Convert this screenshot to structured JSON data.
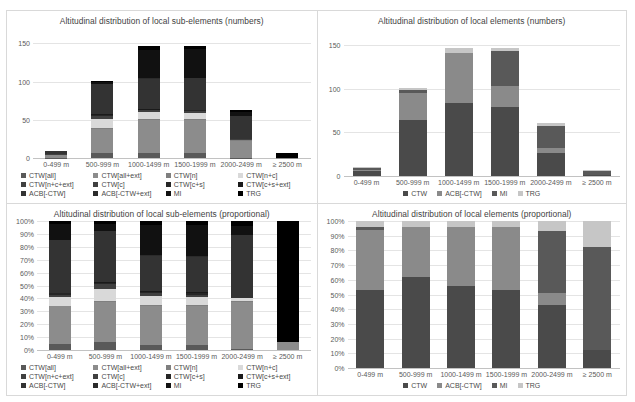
{
  "figure": {
    "background": "#ffffff",
    "panel_border": "#d9d9d9"
  },
  "series_colors": {
    "CTW[all]": "#595959",
    "CTW[all+ext]": "#8c8c8c",
    "CTW[n]": "#7f7f7f",
    "CTW[n+c]": "#d9d9d9",
    "CTW[n+c+ext]": "#404040",
    "CTW[c]": "#404040",
    "CTW[c+s]": "#262626",
    "CTW[c+s+ext]": "#1a1a1a",
    "ACB[-CTW]": "#333333",
    "ACB[-CTW+ext]": "#2b2b2b",
    "MI": "#111111",
    "TRG": "#000000",
    "CTW": "#4a4a4a",
    "ACB[-CTW]_elem": "#8a8a8a",
    "MI_elem": "#595959",
    "TRG_elem": "#c6c6c6"
  },
  "categories": [
    "0-499 m",
    "500-999 m",
    "1000-1499 m",
    "1500-1999 m",
    "2000-2499 m",
    "≥ 2500 m"
  ],
  "panels": {
    "top_left": {
      "name": "sub-elements-numbers",
      "chart_data": {
        "type": "bar",
        "stacked": true,
        "title": "Altitudinal distribution of local sub-elements (numbers)",
        "xlabel": "",
        "ylabel": "",
        "ylim": [
          0,
          170
        ],
        "yticks": [
          0,
          50,
          100,
          150
        ],
        "ytick_labels": [
          "0",
          "50",
          "100",
          "150"
        ],
        "grid": true,
        "legend_position": "bottom",
        "categories": [
          "0-499 m",
          "500-999 m",
          "1000-1499 m",
          "1500-1999 m",
          "2000-2499 m",
          "≥ 2500 m"
        ],
        "series": [
          {
            "name": "CTW[all]",
            "color": "#595959",
            "values": [
              2,
              8,
              7,
              7,
              1,
              0
            ]
          },
          {
            "name": "CTW[all+ext]",
            "color": "#8c8c8c",
            "values": [
              12,
              42,
              47,
              47,
              36,
              2
            ]
          },
          {
            "name": "CTW[n]",
            "color": "#7f7f7f",
            "values": [
              0,
              1,
              1,
              1,
              1,
              0
            ]
          },
          {
            "name": "CTW[n+c]",
            "color": "#d9d9d9",
            "values": [
              4,
              16,
              10,
              9,
              2,
              0
            ]
          },
          {
            "name": "CTW[n+c+ext]",
            "color": "#404040",
            "values": [
              1,
              1,
              1,
              1,
              1,
              0
            ]
          },
          {
            "name": "CTW[c]",
            "color": "#404040",
            "values": [
              1,
              4,
              1,
              1,
              0,
              0
            ]
          },
          {
            "name": "CTW[c+s]",
            "color": "#262626",
            "values": [
              1,
              1,
              1,
              1,
              0,
              0
            ]
          },
          {
            "name": "CTW[c+s+ext]",
            "color": "#1a1a1a",
            "values": [
              0,
              1,
              1,
              1,
              0,
              0
            ]
          },
          {
            "name": "ACB[-CTW]",
            "color": "#333333",
            "values": [
              17,
              51,
              42,
              44,
              50,
              0
            ]
          },
          {
            "name": "ACB[-CTW+ext]",
            "color": "#2b2b2b",
            "values": [
              0,
              0,
              1,
              1,
              0,
              0
            ]
          },
          {
            "name": "MI",
            "color": "#111111",
            "values": [
              2,
              4,
              40,
              40,
              8,
              0
            ]
          },
          {
            "name": "TRG",
            "color": "#000000",
            "values": [
              1,
              2,
              6,
              5,
              4,
              32
            ]
          }
        ]
      },
      "legend": [
        {
          "label": "CTW[all]",
          "color": "#595959"
        },
        {
          "label": "CTW[all+ext]",
          "color": "#8c8c8c"
        },
        {
          "label": "CTW[n]",
          "color": "#7f7f7f"
        },
        {
          "label": "CTW[n+c]",
          "color": "#d9d9d9"
        },
        {
          "label": "CTW[n+c+ext]",
          "color": "#404040"
        },
        {
          "label": "CTW[c]",
          "color": "#404040"
        },
        {
          "label": "CTW[c+s]",
          "color": "#262626"
        },
        {
          "label": "CTW[c+s+ext]",
          "color": "#1a1a1a"
        },
        {
          "label": "ACB[-CTW]",
          "color": "#333333"
        },
        {
          "label": "ACB[-CTW+ext]",
          "color": "#2b2b2b"
        },
        {
          "label": "MI",
          "color": "#111111"
        },
        {
          "label": "TRG",
          "color": "#000000"
        }
      ]
    },
    "top_right": {
      "name": "elements-numbers",
      "chart_data": {
        "type": "bar",
        "stacked": true,
        "title": "Altitudinal distribution of local elements (numbers)",
        "xlabel": "",
        "ylabel": "",
        "ylim": [
          0,
          170
        ],
        "yticks": [
          0,
          50,
          100,
          150
        ],
        "ytick_labels": [
          "0",
          "50",
          "100",
          "150"
        ],
        "grid": true,
        "legend_position": "bottom",
        "categories": [
          "0-499 m",
          "500-999 m",
          "1000-1499 m",
          "1500-1999 m",
          "2000-2499 m",
          "≥ 2500 m"
        ],
        "series": [
          {
            "name": "CTW",
            "color": "#4a4a4a",
            "values": [
              22,
              83,
              90,
              85,
              45,
              4
            ]
          },
          {
            "name": "ACB[-CTW]",
            "color": "#8a8a8a",
            "values": [
              9,
              41,
              62,
              26,
              8,
              0
            ]
          },
          {
            "name": "MI",
            "color": "#595959",
            "values": [
              8,
              4,
              0,
              44,
              43,
              24
            ]
          },
          {
            "name": "TRG",
            "color": "#c6c6c6",
            "values": [
              2,
              3,
              6,
              3,
              6,
              6
            ]
          }
        ]
      },
      "legend": [
        {
          "label": "CTW",
          "color": "#4a4a4a"
        },
        {
          "label": "ACB[-CTW]",
          "color": "#8a8a8a"
        },
        {
          "label": "MI",
          "color": "#595959"
        },
        {
          "label": "TRG",
          "color": "#c6c6c6"
        }
      ]
    },
    "bottom_left": {
      "name": "sub-elements-proportional",
      "chart_data": {
        "type": "bar",
        "stacked": true,
        "normalized": true,
        "title": "Altitudinal distribution of local sub-elements (proportional)",
        "xlabel": "",
        "ylabel": "",
        "ylim": [
          0,
          100
        ],
        "yticks": [
          0,
          10,
          20,
          30,
          40,
          50,
          60,
          70,
          80,
          90,
          100
        ],
        "ytick_labels": [
          "0%",
          "10%",
          "20%",
          "30%",
          "40%",
          "50%",
          "60%",
          "70%",
          "80%",
          "90%",
          "100%"
        ],
        "grid": true,
        "legend_position": "bottom",
        "categories": [
          "0-499 m",
          "500-999 m",
          "1000-1499 m",
          "1500-1999 m",
          "2000-2499 m",
          "≥ 2500 m"
        ],
        "series": [
          {
            "name": "CTW[all]",
            "color": "#595959",
            "values": [
              5,
              6,
              4,
              4,
              1,
              0
            ]
          },
          {
            "name": "CTW[all+ext]",
            "color": "#8c8c8c",
            "values": [
              29,
              31,
              30,
              30,
              36,
              6
            ]
          },
          {
            "name": "CTW[n]",
            "color": "#7f7f7f",
            "values": [
              0,
              1,
              1,
              1,
              1,
              0
            ]
          },
          {
            "name": "CTW[n+c]",
            "color": "#d9d9d9",
            "values": [
              7,
              9,
              7,
              6,
              2,
              0
            ]
          },
          {
            "name": "CTW[n+c+ext]",
            "color": "#404040",
            "values": [
              1,
              1,
              1,
              1,
              0,
              0
            ]
          },
          {
            "name": "CTW[c]",
            "color": "#404040",
            "values": [
              1,
              3,
              1,
              1,
              0,
              0
            ]
          },
          {
            "name": "CTW[c+s]",
            "color": "#262626",
            "values": [
              1,
              1,
              1,
              1,
              0,
              0
            ]
          },
          {
            "name": "CTW[c+s+ext]",
            "color": "#1a1a1a",
            "values": [
              0,
              1,
              1,
              1,
              0,
              0
            ]
          },
          {
            "name": "ACB[-CTW]",
            "color": "#333333",
            "values": [
              41,
              39,
              27,
              27,
              49,
              0
            ]
          },
          {
            "name": "ACB[-CTW+ext]",
            "color": "#2b2b2b",
            "values": [
              0,
              0,
              1,
              1,
              0,
              0
            ]
          },
          {
            "name": "MI",
            "color": "#111111",
            "values": [
              13,
              6,
              23,
              24,
              7,
              0
            ]
          },
          {
            "name": "TRG",
            "color": "#000000",
            "values": [
              2,
              2,
              3,
              3,
              4,
              94
            ]
          }
        ]
      },
      "legend": [
        {
          "label": "CTW[all]",
          "color": "#595959"
        },
        {
          "label": "CTW[all+ext]",
          "color": "#8c8c8c"
        },
        {
          "label": "CTW[n]",
          "color": "#7f7f7f"
        },
        {
          "label": "CTW[n+c]",
          "color": "#d9d9d9"
        },
        {
          "label": "CTW[n+c+ext]",
          "color": "#404040"
        },
        {
          "label": "CTW[c]",
          "color": "#404040"
        },
        {
          "label": "CTW[c+s]",
          "color": "#262626"
        },
        {
          "label": "CTW[c+s+ext]",
          "color": "#1a1a1a"
        },
        {
          "label": "ACB[-CTW]",
          "color": "#333333"
        },
        {
          "label": "ACB[-CTW+ext]",
          "color": "#2b2b2b"
        },
        {
          "label": "MI",
          "color": "#111111"
        },
        {
          "label": "TRG",
          "color": "#000000"
        }
      ]
    },
    "bottom_right": {
      "name": "elements-proportional",
      "chart_data": {
        "type": "bar",
        "stacked": true,
        "normalized": true,
        "title": "Altitudinal distribution of local elements (proportional)",
        "xlabel": "",
        "ylabel": "",
        "ylim": [
          0,
          100
        ],
        "yticks": [
          0,
          10,
          20,
          30,
          40,
          50,
          60,
          70,
          80,
          90,
          100
        ],
        "ytick_labels": [
          "0%",
          "10%",
          "20%",
          "30%",
          "40%",
          "50%",
          "60%",
          "70%",
          "80%",
          "90%",
          "100%"
        ],
        "grid": true,
        "legend_position": "bottom",
        "categories": [
          "0-499 m",
          "500-999 m",
          "1000-1499 m",
          "1500-1999 m",
          "2000-2499 m",
          "≥ 2500 m"
        ],
        "series": [
          {
            "name": "CTW",
            "color": "#4a4a4a",
            "values": [
              53,
              62,
              56,
              53,
              43,
              12
            ]
          },
          {
            "name": "ACB[-CTW]",
            "color": "#8a8a8a",
            "values": [
              41,
              34,
              40,
              43,
              8,
              0
            ]
          },
          {
            "name": "MI",
            "color": "#595959",
            "values": [
              2,
              0,
              0,
              0,
              42,
              70
            ]
          },
          {
            "name": "TRG",
            "color": "#c6c6c6",
            "values": [
              4,
              4,
              4,
              4,
              7,
              18
            ]
          }
        ]
      },
      "legend": [
        {
          "label": "CTW",
          "color": "#4a4a4a"
        },
        {
          "label": "ACB[-CTW]",
          "color": "#8a8a8a"
        },
        {
          "label": "MI",
          "color": "#595959"
        },
        {
          "label": "TRG",
          "color": "#c6c6c6"
        }
      ]
    }
  }
}
